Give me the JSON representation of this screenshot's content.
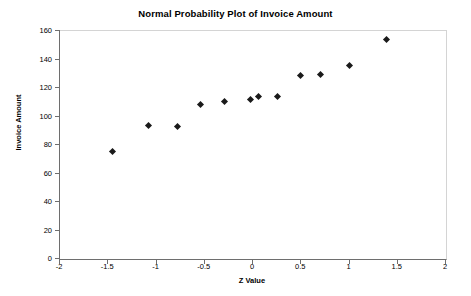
{
  "chart_data": {
    "type": "scatter",
    "title": "Normal Probability Plot of Invoice Amount",
    "xlabel": "Z Value",
    "ylabel": "Invoice Amount",
    "xlim": [
      -2,
      2
    ],
    "ylim": [
      0,
      160
    ],
    "xticks": [
      -2,
      -1.5,
      -1,
      -0.5,
      0,
      0.5,
      1,
      1.5,
      2
    ],
    "xtick_labels": [
      "-2",
      "-1.5",
      "-1",
      "-0.5",
      "0",
      "0.5",
      "1",
      "1.5",
      "2"
    ],
    "yticks": [
      0,
      20,
      40,
      60,
      80,
      100,
      120,
      140,
      160
    ],
    "ytick_labels": [
      "0",
      "20",
      "40",
      "60",
      "80",
      "100",
      "120",
      "140",
      "160"
    ],
    "grid": false,
    "legend": null,
    "marker": "diamond",
    "marker_color": "#1a1a1a",
    "points": [
      {
        "x": -1.45,
        "y": 75
      },
      {
        "x": -1.07,
        "y": 93
      },
      {
        "x": -0.77,
        "y": 92.5
      },
      {
        "x": -0.53,
        "y": 108
      },
      {
        "x": -0.29,
        "y": 110
      },
      {
        "x": -0.02,
        "y": 111
      },
      {
        "x": 0.07,
        "y": 113
      },
      {
        "x": 0.26,
        "y": 113
      },
      {
        "x": 0.5,
        "y": 128
      },
      {
        "x": 0.71,
        "y": 129
      },
      {
        "x": 1.01,
        "y": 135
      },
      {
        "x": 1.39,
        "y": 153
      }
    ],
    "x": [
      -1.45,
      -1.07,
      -0.77,
      -0.53,
      -0.29,
      -0.02,
      0.07,
      0.26,
      0.5,
      0.71,
      1.01,
      1.39
    ],
    "values": [
      75,
      93,
      92.5,
      108,
      110,
      111,
      113,
      113,
      128,
      129,
      135,
      153
    ]
  },
  "colors": {
    "marker": "#1a1a1a",
    "axis": "#6e6e6e",
    "plot_border": "#d4d4d4",
    "background": "#ffffff",
    "text": "#000000"
  }
}
